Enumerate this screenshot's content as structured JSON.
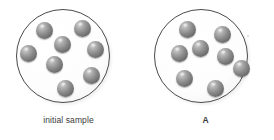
{
  "figure": {
    "background_color": "#ffffff",
    "width": 274,
    "height": 140
  },
  "panels": [
    {
      "id": "initial-sample",
      "caption": "initial sample",
      "caption_bold": false,
      "circle": {
        "outline_color": "#4a4a4a",
        "fill_color": "#fdfdfd",
        "cx": 63,
        "cy": 56,
        "r": 47
      },
      "particle_count": 8,
      "particle_color": "#6e6e6e",
      "particles": [
        {
          "cx": 44,
          "cy": 30,
          "r": 8.5
        },
        {
          "cx": 82,
          "cy": 28,
          "r": 8.5
        },
        {
          "cx": 62,
          "cy": 44,
          "r": 8.5
        },
        {
          "cx": 28,
          "cy": 53,
          "r": 8.5
        },
        {
          "cx": 95,
          "cy": 49,
          "r": 8.5
        },
        {
          "cx": 54,
          "cy": 64,
          "r": 8.5
        },
        {
          "cx": 91,
          "cy": 75,
          "r": 8.5
        },
        {
          "cx": 65,
          "cy": 88,
          "r": 8.5
        }
      ]
    },
    {
      "id": "sample-a",
      "caption": "A",
      "caption_bold": true,
      "circle": {
        "outline_color": "#4a4a4a",
        "fill_color": "#fdfdfd",
        "cx": 64,
        "cy": 56,
        "r": 47
      },
      "particle_count": 8,
      "particle_color": "#6e6e6e",
      "particles": [
        {
          "cx": 50,
          "cy": 29,
          "r": 8.5
        },
        {
          "cx": 85,
          "cy": 34,
          "r": 8.5
        },
        {
          "cx": 42,
          "cy": 53,
          "r": 8.5
        },
        {
          "cx": 63,
          "cy": 48,
          "r": 8.5
        },
        {
          "cx": 88,
          "cy": 56,
          "r": 8.5
        },
        {
          "cx": 104,
          "cy": 68,
          "r": 8.5
        },
        {
          "cx": 47,
          "cy": 78,
          "r": 8.5
        },
        {
          "cx": 78,
          "cy": 88,
          "r": 8.5
        }
      ]
    }
  ],
  "marks": {
    "speck": {
      "x": 247,
      "y": 35
    }
  }
}
